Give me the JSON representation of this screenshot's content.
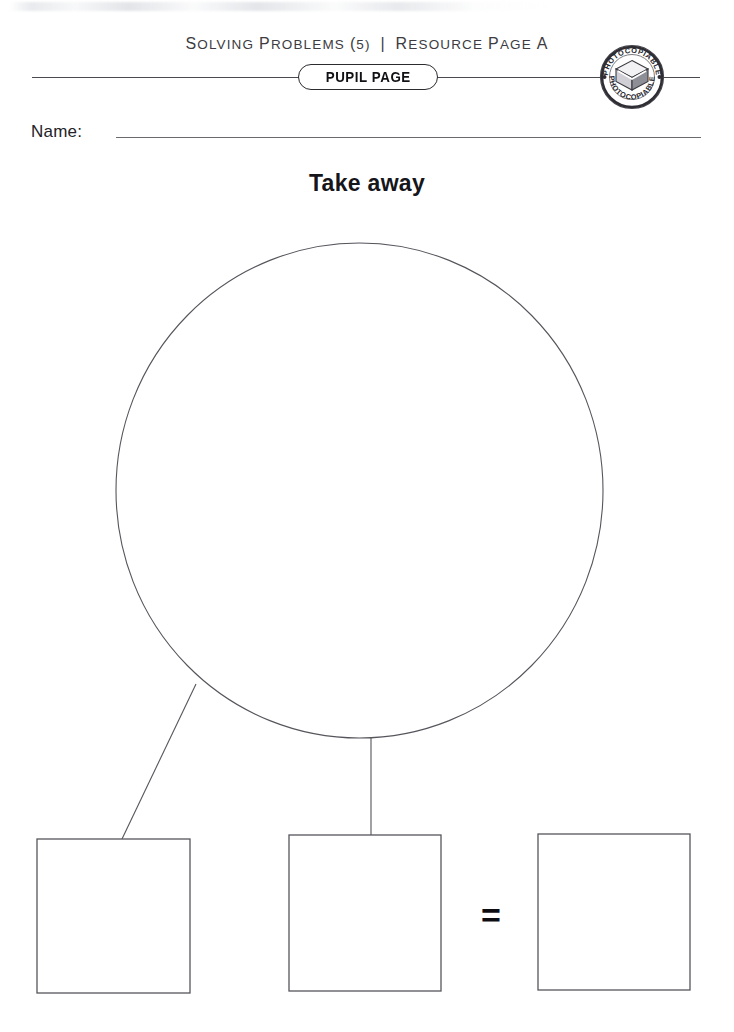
{
  "page": {
    "header_caption": "Solving Problems (5)  |  Resource Page A",
    "badge_label": "PUPIL PAGE",
    "stamp_label": "PHOTOCOPIABLE",
    "name_label": "Name:",
    "name_value": "",
    "title": "Take away",
    "equals_symbol": "=",
    "colors": {
      "ink": "#1a1a1a",
      "rule": "#4a4a50",
      "shape_stroke": "#55555c",
      "paper": "#ffffff"
    }
  },
  "diagram": {
    "circle": {
      "name": "total-circle",
      "cx": 359.5,
      "cy": 490.5,
      "rx": 243.5,
      "ry": 247.5,
      "value": ""
    },
    "connectors": [
      {
        "name": "connector-circle-to-box-1",
        "x1": 196,
        "y1": 684,
        "x2": 122,
        "y2": 839
      },
      {
        "name": "connector-circle-to-box-2",
        "x1": 371,
        "y1": 738,
        "x2": 371,
        "y2": 835
      }
    ],
    "boxes": [
      {
        "name": "answer-box-1",
        "x": 37,
        "y": 839,
        "w": 153,
        "h": 154,
        "value": ""
      },
      {
        "name": "answer-box-2",
        "x": 289,
        "y": 835,
        "w": 152,
        "h": 156,
        "value": ""
      },
      {
        "name": "answer-box-3",
        "x": 538,
        "y": 834,
        "w": 152,
        "h": 156,
        "value": ""
      }
    ]
  }
}
